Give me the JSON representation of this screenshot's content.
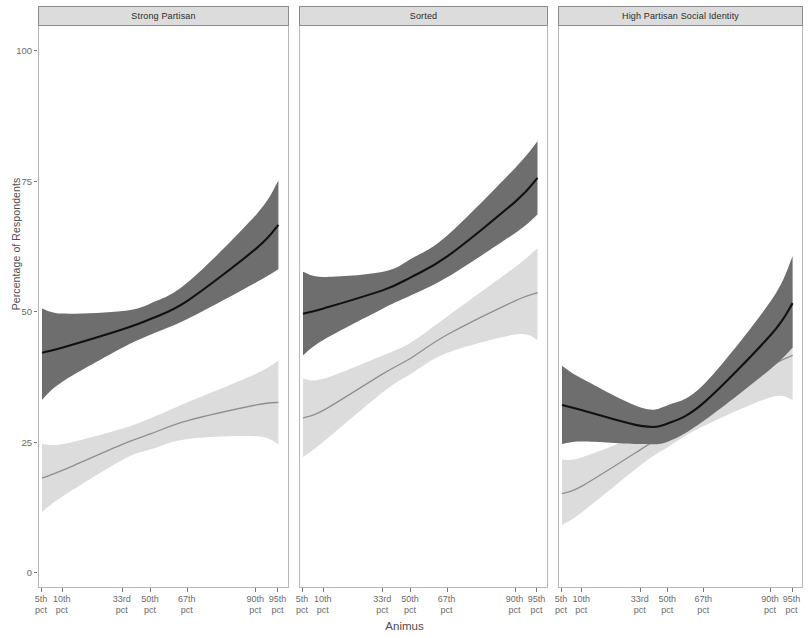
{
  "figure": {
    "axis_x_title": "Animus",
    "axis_y_title": "Percentage of Respondents",
    "y_ticks": [
      "0",
      "25",
      "50",
      "75",
      "100"
    ],
    "x_ticks": [
      {
        "line1": "5th",
        "line2": "pct"
      },
      {
        "line1": "10th",
        "line2": "pct"
      },
      {
        "line1": "33rd",
        "line2": "pct"
      },
      {
        "line1": "50th",
        "line2": "pct"
      },
      {
        "line1": "67th",
        "line2": "pct"
      },
      {
        "line1": "90th",
        "line2": "pct"
      },
      {
        "line1": "95th",
        "line2": "pct"
      }
    ],
    "panels": [
      {
        "title": "Strong Partisan"
      },
      {
        "title": "Sorted"
      },
      {
        "title": "High Partisan Social Identity"
      }
    ],
    "colors": {
      "dark_line": "#111111",
      "dark_band": "#6e6e6e",
      "light_line": "#8f8f8f",
      "light_band": "#dcdcdc",
      "panel_strip": "#dcdcdc",
      "panel_border": "#b7b7b7",
      "text": "#4d4d4d"
    }
  },
  "chart_data": {
    "type": "line",
    "title": "",
    "subtitle": "",
    "xlabel": "Animus",
    "ylabel": "Percentage of Respondents",
    "ylim": [
      0,
      100
    ],
    "ytick_values": [
      0,
      25,
      50,
      75,
      100
    ],
    "grid": false,
    "legend": "none",
    "x": [
      "5th pct",
      "10th pct",
      "33rd pct",
      "50th pct",
      "67th pct",
      "90th pct",
      "95th pct"
    ],
    "x_positions": [
      0.0,
      0.085,
      0.33,
      0.445,
      0.595,
      0.875,
      0.965
    ],
    "facets": [
      {
        "name": "Strong Partisan",
        "series": [
          {
            "name": "dark",
            "values": [
              42.0,
              43.0,
              46.5,
              48.5,
              52.0,
              62.0,
              66.5
            ],
            "ci_lower": [
              33.0,
              36.5,
              43.0,
              45.5,
              48.5,
              55.5,
              58.0
            ],
            "ci_upper": [
              50.5,
              49.5,
              50.0,
              51.5,
              55.5,
              68.5,
              75.0
            ]
          },
          {
            "name": "light",
            "values": [
              18.0,
              19.5,
              24.5,
              26.5,
              29.0,
              32.0,
              32.5
            ],
            "ci_lower": [
              11.5,
              14.5,
              21.5,
              23.5,
              25.5,
              26.0,
              24.5
            ],
            "ci_upper": [
              24.5,
              24.5,
              27.5,
              29.5,
              32.5,
              38.0,
              40.5
            ]
          }
        ]
      },
      {
        "name": "Sorted",
        "series": [
          {
            "name": "dark",
            "values": [
              49.5,
              50.5,
              54.0,
              56.5,
              60.5,
              71.0,
              75.5
            ],
            "ci_lower": [
              41.5,
              44.5,
              50.5,
              53.0,
              56.5,
              65.0,
              68.5
            ],
            "ci_upper": [
              57.5,
              56.5,
              57.5,
              60.0,
              64.5,
              77.5,
              82.5
            ]
          },
          {
            "name": "light",
            "values": [
              29.5,
              31.0,
              38.0,
              41.0,
              45.5,
              52.0,
              53.5
            ],
            "ci_lower": [
              22.0,
              25.0,
              34.5,
              38.0,
              42.0,
              45.5,
              44.5
            ],
            "ci_upper": [
              37.0,
              37.0,
              41.5,
              44.0,
              49.0,
              58.5,
              62.0
            ]
          }
        ]
      },
      {
        "name": "High Partisan Social Identity",
        "series": [
          {
            "name": "dark",
            "values": [
              32.0,
              31.0,
              28.0,
              28.5,
              32.5,
              45.5,
              51.5
            ],
            "ci_lower": [
              24.5,
              25.0,
              24.5,
              25.0,
              29.0,
              39.0,
              43.0
            ],
            "ci_upper": [
              39.5,
              37.0,
              31.5,
              32.0,
              36.0,
              52.0,
              60.5
            ]
          },
          {
            "name": "light",
            "values": [
              15.0,
              16.5,
              23.5,
              27.0,
              31.5,
              39.5,
              41.5
            ],
            "ci_lower": [
              9.0,
              11.5,
              20.5,
              24.0,
              28.0,
              33.5,
              33.0
            ],
            "ci_upper": [
              21.5,
              22.0,
              26.5,
              30.0,
              35.0,
              45.5,
              50.0
            ]
          }
        ]
      }
    ]
  }
}
